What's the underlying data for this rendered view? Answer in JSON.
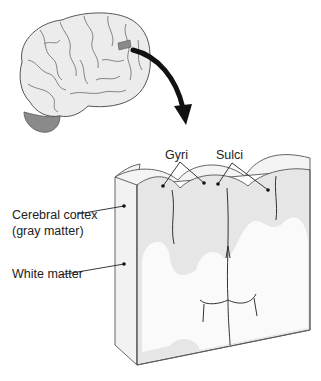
{
  "diagram": {
    "labels": {
      "gyri": "Gyri",
      "sulci": "Sulci",
      "cortex_line1": "Cerebral cortex",
      "cortex_line2": "(gray matter)",
      "white_matter": "White matter"
    },
    "colors": {
      "brain_fill": "#ececec",
      "brain_outline": "#555555",
      "highlight_patch": "#8a8a8a",
      "cerebellum": "#7a7a7a",
      "arrow": "#111111",
      "gray_matter": "#e6e6e6",
      "white_matter": "#fafafa",
      "edge": "#555555"
    }
  }
}
